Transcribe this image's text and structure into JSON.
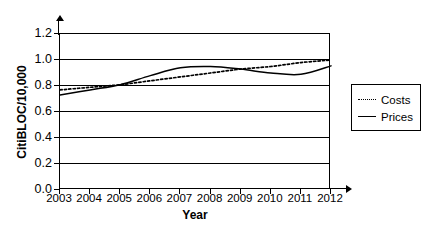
{
  "caption": {
    "clipped_text": ""
  },
  "chart_data": {
    "type": "line",
    "title": "",
    "xlabel": "Year",
    "ylabel": "CitiBLOC/10,000",
    "xlim": [
      2003,
      2012
    ],
    "ylim": [
      0.0,
      1.2
    ],
    "grid": true,
    "legend_position": "right",
    "categories": [
      "2003",
      "2004",
      "2005",
      "2006",
      "2007",
      "2008",
      "2009",
      "2010",
      "2011",
      "2012"
    ],
    "x": [
      2003,
      2004,
      2005,
      2006,
      2007,
      2008,
      2009,
      2010,
      2011,
      2012
    ],
    "yticks": [
      "0.0",
      "0.2",
      "0.4",
      "0.6",
      "0.8",
      "1.0",
      "1.2"
    ],
    "ytick_values": [
      0.0,
      0.2,
      0.4,
      0.6,
      0.8,
      1.0,
      1.2
    ],
    "xticks": [
      "2003",
      "2004",
      "2005",
      "2006",
      "2007",
      "2008",
      "2009",
      "2010",
      "2011",
      "2012"
    ],
    "series": [
      {
        "name": "Costs",
        "style": "dotted",
        "color": "#000000",
        "values": [
          0.77,
          0.79,
          0.81,
          0.84,
          0.87,
          0.9,
          0.93,
          0.95,
          0.98,
          1.0
        ]
      },
      {
        "name": "Prices",
        "style": "solid",
        "color": "#000000",
        "values": [
          0.73,
          0.77,
          0.81,
          0.88,
          0.94,
          0.95,
          0.93,
          0.9,
          0.89,
          0.955
        ]
      }
    ]
  },
  "legend": {
    "items": [
      {
        "label": "Costs",
        "style": "dotted"
      },
      {
        "label": "Prices",
        "style": "solid"
      }
    ]
  }
}
